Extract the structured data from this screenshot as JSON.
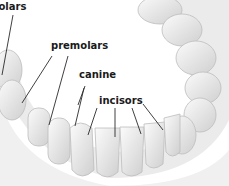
{
  "diagram": {
    "labels": [
      {
        "id": "molars",
        "text": "molars"
      },
      {
        "id": "premolars",
        "text": "premolars"
      },
      {
        "id": "canine",
        "text": "canine"
      },
      {
        "id": "incisors",
        "text": "incisors"
      }
    ],
    "colors": {
      "tooth": "#f2f2f2",
      "tooth_shade": "#cfcfcf",
      "gum_shade": "#bdbdbd",
      "leader_line": "#2a2a2a",
      "label_text": "#1a1a1a"
    }
  }
}
